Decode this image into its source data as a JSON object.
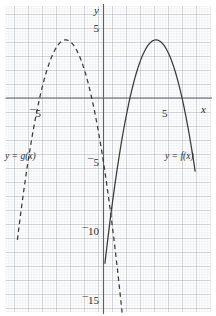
{
  "figure": {
    "background_color": "#ffffff",
    "minor_grid_color": "#c9cfd6",
    "major_grid_color": "#8f979f",
    "axis_color": "#5a6069",
    "curve_color": "#3a3a3a"
  },
  "axes": {
    "x_axis_label": "x",
    "y_axis_label": "y",
    "x_ticks": [
      {
        "label": "¯5",
        "value": -5
      },
      {
        "label": "5",
        "value": 5
      }
    ],
    "y_ticks": [
      {
        "label": "5",
        "value": 5
      },
      {
        "label": "¯5",
        "value": -5
      },
      {
        "label": "¯10",
        "value": -10
      },
      {
        "label": "¯15",
        "value": -15
      }
    ],
    "xlim": [
      -7.4,
      8.0
    ],
    "ylim": [
      -15.6,
      6.4
    ],
    "grid": true,
    "minor_grid_step": 0.2,
    "major_grid_step": 1
  },
  "labels": {
    "g_label": "y = g(x)",
    "f_label": "y = f(x)"
  },
  "chart_data": {
    "type": "line",
    "title": "",
    "xlabel": "x",
    "ylabel": "y",
    "xlim": [
      -7.4,
      8.0
    ],
    "ylim": [
      -15.6,
      6.4
    ],
    "grid": true,
    "legend": "inline-annotations",
    "series": [
      {
        "name": "y = g(x)",
        "style": "dashed",
        "vertex": [
          -2.7,
          4.15
        ],
        "x_intercepts": [
          -5.65,
          0.25
        ],
        "domain": [
          -6.15,
          1.35
        ],
        "quadratic_coefficients": {
          "a": -1.2,
          "h": -2.7,
          "k": 4.15
        },
        "label_position": [
          -6.9,
          -5.0
        ]
      },
      {
        "name": "y = f(x)",
        "style": "solid",
        "vertex": [
          3.75,
          4.15
        ],
        "x_intercepts": [
          1.9,
          5.6
        ],
        "domain": [
          0.1,
          6.55
        ],
        "quadratic_coefficients": {
          "a": -1.2,
          "h": 3.75,
          "k": 4.15
        },
        "label_position": [
          4.4,
          -5.0
        ]
      }
    ]
  }
}
